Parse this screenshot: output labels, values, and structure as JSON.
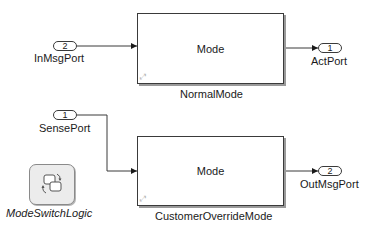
{
  "diagram": {
    "type": "Simulink model",
    "blocks": {
      "normal_mode": {
        "title": "Mode",
        "label": "NormalMode",
        "link_glyph": "⤢"
      },
      "customer_override_mode": {
        "title": "Mode",
        "label": "CustomerOverrideMode",
        "link_glyph": "⤢"
      },
      "mode_switch_logic": {
        "label": "ModeSwitchLogic",
        "icon": "stateflow-chart-icon"
      }
    },
    "inports": [
      {
        "number": "2",
        "label": "InMsgPort"
      },
      {
        "number": "1",
        "label": "SensePort"
      }
    ],
    "outports": [
      {
        "number": "1",
        "label": "ActPort"
      },
      {
        "number": "2",
        "label": "OutMsgPort"
      }
    ],
    "connections": [
      {
        "from": "InMsgPort",
        "to": "NormalMode"
      },
      {
        "from": "NormalMode",
        "to": "ActPort"
      },
      {
        "from": "SensePort",
        "to": "CustomerOverrideMode"
      },
      {
        "from": "CustomerOverrideMode",
        "to": "OutMsgPort"
      }
    ],
    "colors": {
      "line": "#3a3a3a",
      "background": "#ffffff",
      "chart_fill": "#ececec"
    }
  }
}
